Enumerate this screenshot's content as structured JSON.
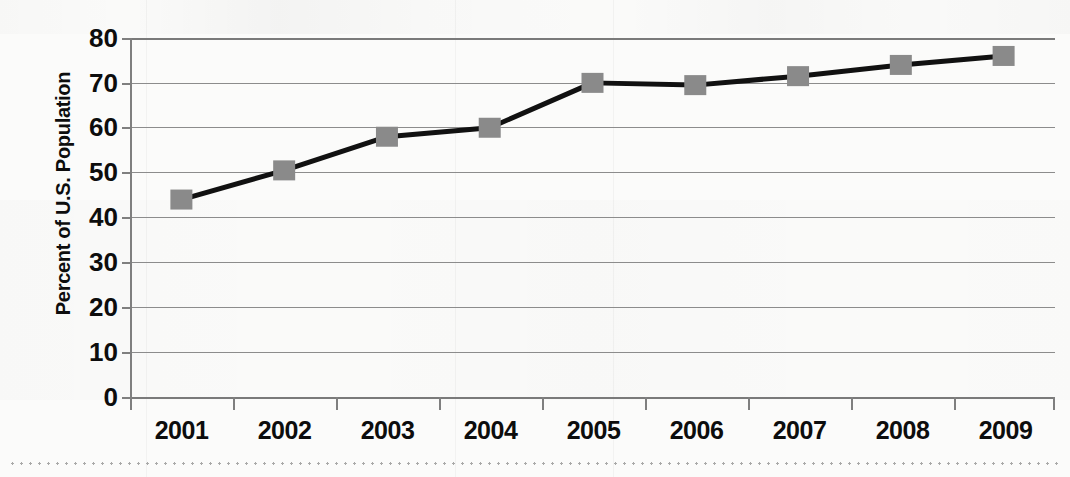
{
  "chart_data": {
    "type": "line",
    "title": "",
    "xlabel": "",
    "ylabel": "Percent of U.S. Population",
    "categories": [
      "2001",
      "2002",
      "2003",
      "2004",
      "2005",
      "2006",
      "2007",
      "2008",
      "2009"
    ],
    "values": [
      44,
      50.5,
      58,
      60,
      70,
      69.5,
      71.5,
      74,
      76
    ],
    "series": [
      {
        "name": "Percent of U.S. Population",
        "values": [
          44,
          50.5,
          58,
          60,
          70,
          69.5,
          71.5,
          74,
          76
        ]
      }
    ],
    "ylim": [
      0,
      80
    ],
    "yticks": [
      "0",
      "10",
      "20",
      "30",
      "40",
      "50",
      "60",
      "70",
      "80"
    ],
    "ytick_values": [
      0,
      10,
      20,
      30,
      40,
      50,
      60,
      70,
      80
    ],
    "grid": true,
    "grid_axis": "y",
    "legend": false,
    "legend_position": "none",
    "marker": "square",
    "marker_color": "#8a8a8a",
    "line_color": "#111111",
    "gridline_color": "#8c8c8c",
    "axis_color": "#7f7f7f",
    "text_color": "#0d0d0d",
    "background_color": "#fbfbfa"
  }
}
